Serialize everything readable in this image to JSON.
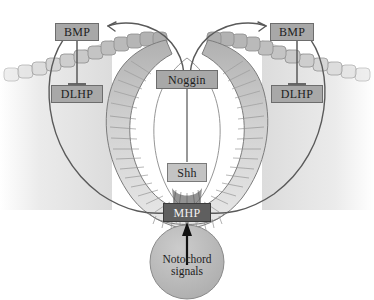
{
  "figure": {
    "background_color": "#ffffff"
  },
  "colors": {
    "box_fill": "#a8a8a8",
    "box_fill_light": "#c3c3c3",
    "box_fill_dark": "#5f5f5f",
    "box_border": "#6d6d6d",
    "arrow_line": "#5a5a5a",
    "arrow_black": "#111111",
    "epidermis": "#c9c9c9",
    "neuroepithelium": "#d9d9d9",
    "notochord_fill": "#b4b4b4",
    "lumen": "#ffffff"
  },
  "labels": {
    "bmp_left": "BMP",
    "bmp_right": "BMP",
    "dlhp_left": "DLHP",
    "dlhp_right": "DLHP",
    "noggin": "Noggin",
    "shh": "Shh",
    "mhp": "MHP",
    "notochord_line1": "Notochord",
    "notochord_line2": "signals"
  },
  "structures": {
    "epidermis_name": "surface ectoderm epidermis",
    "neural_fold_name": "neural fold",
    "neural_tube_name": "neural tube wall",
    "lumen_name": "neural tube lumen",
    "notochord_name": "notochord"
  },
  "connections": [
    {
      "name": "noggin-inhibits-bmp-left",
      "from": "noggin",
      "to": "bmp_left",
      "type": "inhibition-arrow"
    },
    {
      "name": "noggin-inhibits-bmp-right",
      "from": "noggin",
      "to": "bmp_right",
      "type": "inhibition-arrow"
    },
    {
      "name": "bmp-left-to-dlhp-left",
      "from": "bmp_left",
      "to": "dlhp_left",
      "type": "inhibition-bar"
    },
    {
      "name": "bmp-right-to-dlhp-right",
      "from": "bmp_right",
      "to": "dlhp_right",
      "type": "inhibition-bar"
    },
    {
      "name": "noggin-to-shh",
      "from": "noggin",
      "to": "shh",
      "type": "line"
    },
    {
      "name": "mhp-to-dlhp-left",
      "from": "mhp",
      "to": "dlhp_left",
      "type": "curve"
    },
    {
      "name": "mhp-to-dlhp-right",
      "from": "mhp",
      "to": "dlhp_right",
      "type": "curve"
    },
    {
      "name": "notochord-to-mhp",
      "from": "notochord",
      "to": "mhp",
      "type": "arrow"
    }
  ]
}
